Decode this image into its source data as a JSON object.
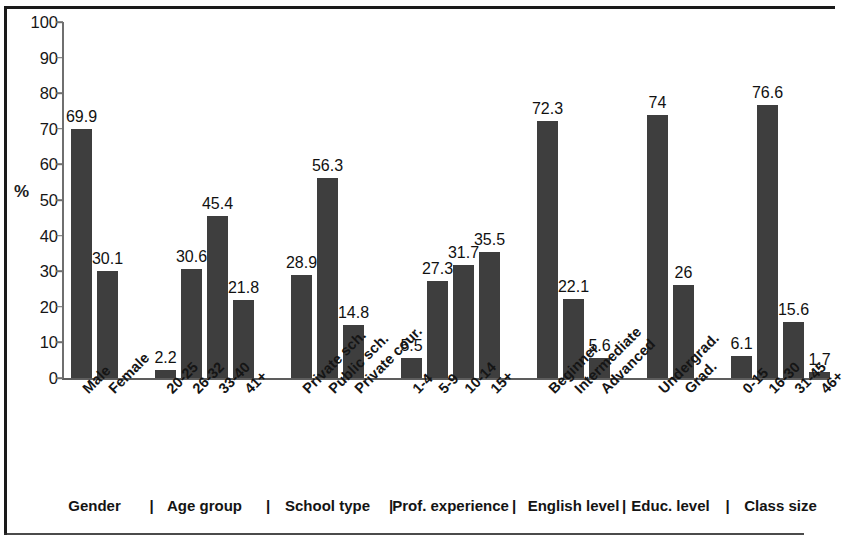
{
  "chart_data": {
    "type": "bar",
    "title": "",
    "xlabel": "",
    "ylabel": "%",
    "ylim": [
      0,
      100
    ],
    "ytick_step": 10,
    "yticks": [
      0,
      10,
      20,
      30,
      40,
      50,
      60,
      70,
      80,
      90,
      100
    ],
    "grid": false,
    "legend_position": "below-axis",
    "bar_color": "#3e3e3e",
    "axis_color": "#6f6f6f",
    "categories": [
      "Male",
      "Female",
      "20-25",
      "26-32",
      "33-40",
      "41+",
      "Private sch.",
      "Public sch.",
      "Private cour.",
      "1-4",
      "5-9",
      "10-14",
      "15+",
      "Beginner",
      "Intermediate",
      "Advanced",
      "Undergrad.",
      "Grad.",
      "0-15",
      "16-30",
      "31-45",
      "46+"
    ],
    "values": [
      69.9,
      30.1,
      2.2,
      30.6,
      45.4,
      21.8,
      28.9,
      56.3,
      14.8,
      5.5,
      27.3,
      31.7,
      35.5,
      72.3,
      22.1,
      5.6,
      74,
      26,
      6.1,
      76.6,
      15.6,
      1.7
    ],
    "value_labels": [
      "69.9",
      "30.1",
      "2.2",
      "30.6",
      "45.4",
      "21.8",
      "28.9",
      "56.3",
      "14.8",
      "5.5",
      "27.3",
      "31.7",
      "35.5",
      "72.3",
      "22.1",
      "5.6",
      "74",
      "26",
      "6.1",
      "76.6",
      "15.6",
      "1.7"
    ],
    "groups": [
      {
        "name": "Gender",
        "categories": [
          "Male",
          "Female"
        ],
        "values": [
          69.9,
          30.1
        ]
      },
      {
        "name": "Age group",
        "categories": [
          "20-25",
          "26-32",
          "33-40",
          "41+"
        ],
        "values": [
          2.2,
          30.6,
          45.4,
          21.8
        ]
      },
      {
        "name": "School type",
        "categories": [
          "Private sch.",
          "Public sch.",
          "Private cour."
        ],
        "values": [
          28.9,
          56.3,
          14.8
        ]
      },
      {
        "name": "Prof. experience",
        "categories": [
          "1-4",
          "5-9",
          "10-14",
          "15+"
        ],
        "values": [
          5.5,
          27.3,
          31.7,
          35.5
        ]
      },
      {
        "name": "English level",
        "categories": [
          "Beginner",
          "Intermediate",
          "Advanced"
        ],
        "values": [
          72.3,
          22.1,
          5.6
        ]
      },
      {
        "name": "Educ. level",
        "categories": [
          "Undergrad.",
          "Grad."
        ],
        "values": [
          74,
          26
        ]
      },
      {
        "name": "Class size",
        "categories": [
          "0-15",
          "16-30",
          "31-45",
          "46+"
        ],
        "values": [
          6.1,
          76.6,
          15.6,
          1.7
        ]
      }
    ]
  },
  "group_legend": {
    "separator": "|",
    "items": [
      "Gender",
      "Age group",
      "School type",
      "Prof. experience",
      "English level",
      "Educ. level",
      "Class size"
    ]
  }
}
